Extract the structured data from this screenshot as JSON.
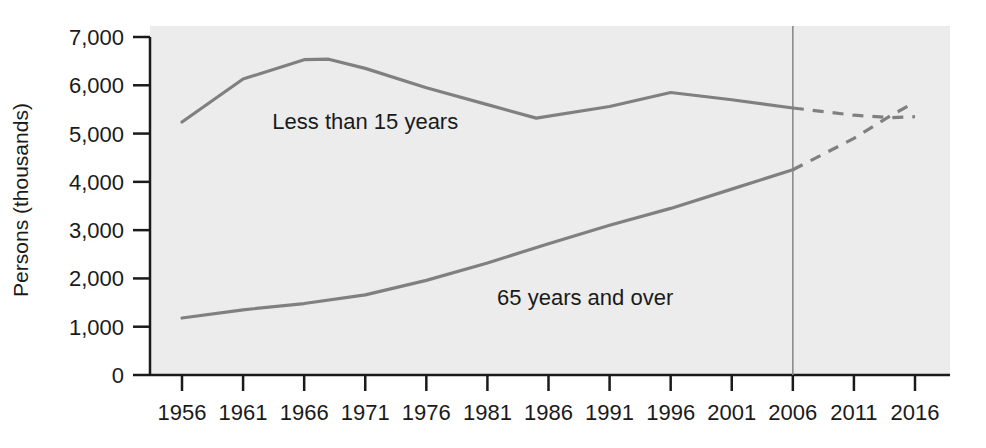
{
  "chart_data": {
    "type": "line",
    "title": "",
    "subtitle": "",
    "xlabel": "",
    "ylabel": "Persons (thousands)",
    "xlim": [
      1956,
      2016
    ],
    "ylim": [
      0,
      7000
    ],
    "grid": false,
    "legend_position": "inline-annotation",
    "x_tick_labels": [
      "1956",
      "1961",
      "1966",
      "1971",
      "1976",
      "1981",
      "1986",
      "1991",
      "1996",
      "2001",
      "2006",
      "2011",
      "2016"
    ],
    "x_ticks": [
      1956,
      1961,
      1966,
      1971,
      1976,
      1981,
      1986,
      1991,
      1996,
      2001,
      2006,
      2011,
      2016
    ],
    "y_tick_labels": [
      "0",
      "1,000",
      "2,000",
      "3,000",
      "4,000",
      "5,000",
      "6,000",
      "7,000"
    ],
    "y_ticks": [
      0,
      1000,
      2000,
      3000,
      4000,
      5000,
      6000,
      7000
    ],
    "projection_divider_year": 2006,
    "annotations": [
      {
        "text": "Less than 15 years",
        "x": 1971,
        "y": 5100
      },
      {
        "text": "65 years and over",
        "x": 1989,
        "y": 1450
      }
    ],
    "series": [
      {
        "name": "Less than 15 years",
        "color": "#808080",
        "actual": {
          "x": [
            1956,
            1961,
            1966,
            1968,
            1971,
            1976,
            1981,
            1985,
            1991,
            1996,
            2001,
            2006
          ],
          "values": [
            5240,
            6130,
            6530,
            6540,
            6350,
            5950,
            5600,
            5320,
            5560,
            5850,
            5700,
            5530
          ]
        },
        "projected": {
          "x": [
            2006,
            2011,
            2014,
            2016
          ],
          "values": [
            5530,
            5380,
            5330,
            5350
          ]
        }
      },
      {
        "name": "65 years and over",
        "color": "#808080",
        "actual": {
          "x": [
            1956,
            1961,
            1966,
            1971,
            1976,
            1981,
            1986,
            1991,
            1996,
            2001,
            2006
          ],
          "values": [
            1180,
            1350,
            1480,
            1660,
            1960,
            2320,
            2720,
            3100,
            3450,
            3850,
            4250
          ]
        },
        "projected": {
          "x": [
            2006,
            2011,
            2014,
            2016
          ],
          "values": [
            4250,
            4900,
            5370,
            5650
          ]
        }
      }
    ]
  },
  "axes": {
    "y_axis_title": "Persons (thousands)"
  },
  "colors": {
    "plot_background": "#ececec",
    "line": "#808080",
    "axis": "#1a1a1a",
    "divider": "#808080",
    "page_background": "#ffffff"
  }
}
